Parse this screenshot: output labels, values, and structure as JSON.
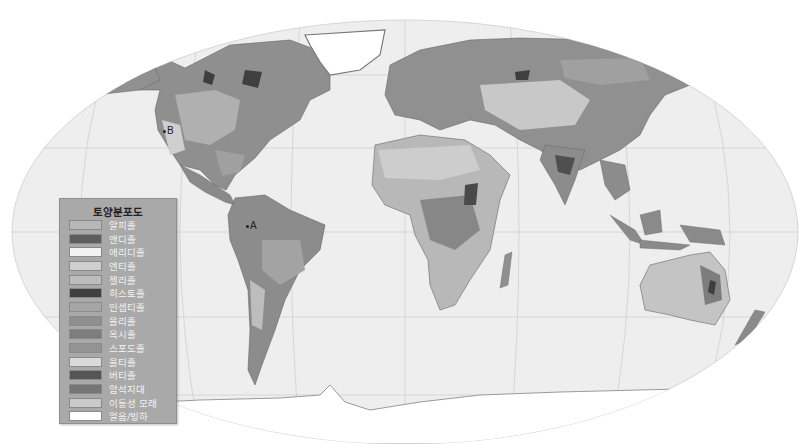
{
  "map": {
    "projection": "Robinson (world)",
    "background": "#ffffff",
    "ocean_color": "#eeeeee",
    "graticule_color": "#cfcfcf",
    "markers": [
      {
        "id": "A",
        "label": "A",
        "x": 247,
        "y": 226
      },
      {
        "id": "B",
        "label": "B",
        "x": 163,
        "y": 131
      }
    ]
  },
  "legend": {
    "title": "토양분포도",
    "items": [
      {
        "label": "알피졸",
        "color": "#b8b8b8"
      },
      {
        "label": "앤디졸",
        "color": "#5e5e5e"
      },
      {
        "label": "애리디졸",
        "color": "#f2f2f2"
      },
      {
        "label": "엔티졸",
        "color": "#cfcfcf"
      },
      {
        "label": "젤리졸",
        "color": "#bdbdbd"
      },
      {
        "label": "히스토졸",
        "color": "#3f3f3f"
      },
      {
        "label": "인셉티졸",
        "color": "#a6a6a6"
      },
      {
        "label": "몰리졸",
        "color": "#8f8f8f"
      },
      {
        "label": "옥시졸",
        "color": "#7d7d7d"
      },
      {
        "label": "스포도졸",
        "color": "#939393"
      },
      {
        "label": "울티졸",
        "color": "#dadada"
      },
      {
        "label": "버티졸",
        "color": "#555555"
      },
      {
        "label": "암석지대",
        "color": "#757575"
      },
      {
        "label": "이동성 모래",
        "color": "#cacaca"
      },
      {
        "label": "얼음/빙하",
        "color": "#ffffff"
      }
    ]
  }
}
